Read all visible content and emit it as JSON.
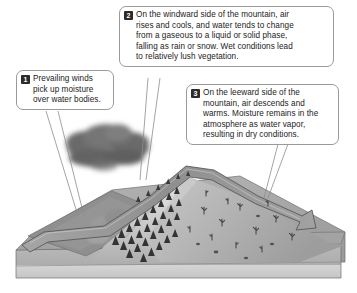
{
  "figure": {
    "type": "block-diagram"
  },
  "callouts": [
    {
      "number": "1",
      "name": "prevailing-winds",
      "lines": [
        "Prevailing winds",
        "pick up moisture",
        "over water bodies."
      ]
    },
    {
      "number": "2",
      "name": "windward-side",
      "lines": [
        "On the windward side of the mountain, air",
        "rises and cools, and water tends to change",
        "from a gaseous to a liquid or solid phase,",
        "falling as rain or snow. Wet conditions lead",
        "to relatively lush vegetation."
      ]
    },
    {
      "number": "3",
      "name": "leeward-side",
      "lines": [
        "On the leeward side of the",
        "mountain, air descends and",
        "warms. Moisture remains in the",
        "atmosphere as water vapor,",
        "resulting in dry conditions."
      ]
    }
  ],
  "scene": {
    "elements": [
      "rain-cloud",
      "water-body",
      "airflow-arrow",
      "conifer-forest",
      "mountain",
      "desert-shrubs",
      "ground-block"
    ]
  },
  "colors": {
    "callout_border": "#9a9a9a",
    "callout_fill": "#ffffff",
    "badge_fill": "#2b2b2b",
    "badge_text": "#ffffff",
    "text": "#1b1b1b",
    "cloud": "#6e6e6e",
    "water": "#8e8e8e",
    "arrow_band": "#9c9c9c",
    "forest": "#3c3c3c",
    "mountain_light": "#cfcfcf",
    "mountain_mid": "#a9a9a9",
    "block_front": "#b6b6b6",
    "block_base": "#d2d2d2"
  }
}
